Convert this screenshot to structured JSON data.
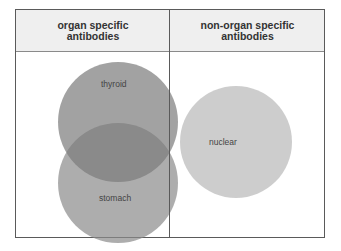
{
  "header": {
    "left": "organ specific\nantibodies",
    "left_line1": "organ specific",
    "left_line2": "antibodies",
    "right_line1": "non-organ specific",
    "right_line2": "antibodies"
  },
  "circles": [
    {
      "label": "thyroid",
      "color": "#8e8e8e"
    },
    {
      "label": "stomach",
      "color": "#9a9a9a"
    },
    {
      "label": "nuclear",
      "color": "#c8c8c8"
    }
  ]
}
